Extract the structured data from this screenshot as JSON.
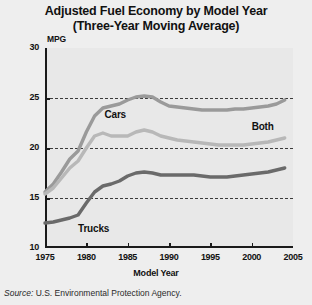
{
  "chart_data": {
    "type": "line",
    "title": "Adjusted Fuel Economy by Model Year",
    "subtitle": "(Three-Year Moving Average)",
    "xlabel": "Model Year",
    "ylabel": "MPG",
    "xlim": [
      1975,
      2005
    ],
    "ylim": [
      10,
      30
    ],
    "xticks": [
      1975,
      1980,
      1985,
      1990,
      1995,
      2000,
      2005
    ],
    "yticks": [
      10,
      15,
      20,
      25,
      30
    ],
    "gridlines": [
      15,
      20,
      25
    ],
    "grid": "horizontal-dashed",
    "legend": "inline-annotations",
    "source": "Source: U.S. Environmental Protection Agency.",
    "source_prefix": "Source:",
    "source_body": " U.S. Environmental Protection Agency.",
    "x": [
      1975,
      1976,
      1977,
      1978,
      1979,
      1980,
      1981,
      1982,
      1983,
      1984,
      1985,
      1986,
      1987,
      1988,
      1989,
      1990,
      1991,
      1992,
      1993,
      1994,
      1995,
      1996,
      1997,
      1998,
      1999,
      2000,
      2001,
      2002,
      2003,
      2004
    ],
    "series": [
      {
        "name": "Cars",
        "color": "#9a9a9a",
        "label_x": 1982.2,
        "label_y": 23.3,
        "values": [
          15.6,
          16.4,
          17.6,
          18.9,
          19.7,
          21.6,
          23.2,
          24.0,
          24.2,
          24.4,
          24.8,
          25.1,
          25.2,
          25.1,
          24.6,
          24.2,
          24.1,
          24.0,
          23.9,
          23.8,
          23.8,
          23.8,
          23.8,
          23.9,
          23.9,
          24.0,
          24.1,
          24.2,
          24.4,
          24.8
        ]
      },
      {
        "name": "Both",
        "color": "#b8b8b8",
        "label_x": 2000.0,
        "label_y": 22.1,
        "values": [
          15.4,
          16.0,
          17.0,
          18.0,
          18.7,
          20.0,
          21.2,
          21.5,
          21.2,
          21.2,
          21.2,
          21.6,
          21.8,
          21.6,
          21.2,
          21.0,
          20.8,
          20.7,
          20.6,
          20.5,
          20.4,
          20.3,
          20.3,
          20.3,
          20.3,
          20.4,
          20.5,
          20.6,
          20.8,
          21.0
        ]
      },
      {
        "name": "Trucks",
        "color": "#6a6a6a",
        "label_x": 1979.0,
        "label_y": 11.9,
        "values": [
          12.5,
          12.6,
          12.8,
          13.0,
          13.3,
          14.5,
          15.6,
          16.2,
          16.4,
          16.7,
          17.2,
          17.5,
          17.6,
          17.5,
          17.3,
          17.3,
          17.3,
          17.3,
          17.3,
          17.2,
          17.1,
          17.1,
          17.1,
          17.2,
          17.3,
          17.4,
          17.5,
          17.6,
          17.8,
          18.0
        ]
      }
    ]
  }
}
